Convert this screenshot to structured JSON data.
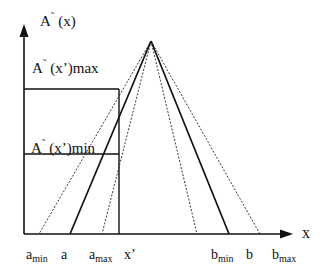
{
  "diagram": {
    "type": "fuzzy-triangular-membership",
    "colors": {
      "line": "#111111",
      "background": "#ffffff"
    },
    "axes": {
      "y_label": {
        "main": "A",
        "tilde": "˜",
        "rest": " (x)"
      },
      "x_label": "x"
    },
    "levels": {
      "max_label": {
        "main": "A",
        "tilde": "˜",
        "rest": " (x’)max"
      },
      "min_label": {
        "main": "A",
        "tilde": "˜",
        "rest": " (x’)min"
      }
    },
    "ticks": {
      "a_min": {
        "base": "a",
        "sub": "min"
      },
      "a": {
        "base": "a"
      },
      "a_max": {
        "base": "a",
        "sub": "max"
      },
      "x_prime": {
        "base": "x’"
      },
      "b_min": {
        "base": "b",
        "sub": "min"
      },
      "b": {
        "base": "b"
      },
      "b_max": {
        "base": "b",
        "sub": "max"
      }
    },
    "lines": [
      {
        "name": "a-solid-line",
        "style": "solid",
        "from": "apex",
        "to": "a"
      },
      {
        "name": "b-solid-line",
        "style": "solid",
        "from": "apex",
        "to": "b"
      },
      {
        "name": "a-min-dashed-line",
        "style": "dotted",
        "from": "apex",
        "to": "a_min"
      },
      {
        "name": "a-max-dashed-line",
        "style": "dotted",
        "from": "apex",
        "to": "a_max"
      },
      {
        "name": "b-min-dashed-line",
        "style": "dotted",
        "from": "apex",
        "to": "b_min"
      },
      {
        "name": "b-max-dashed-line",
        "style": "dotted",
        "from": "apex",
        "to": "b_max"
      }
    ]
  }
}
